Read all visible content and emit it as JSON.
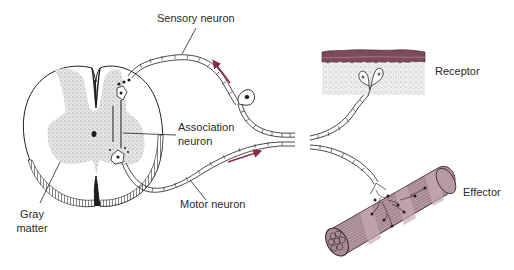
{
  "diagram": {
    "labels": {
      "sensory_neuron": "Sensory neuron",
      "receptor": "Receptor",
      "association_neuron_line1": "Association",
      "association_neuron_line2": "neuron",
      "effector": "Effector",
      "motor_neuron": "Motor neuron",
      "gray_matter_line1": "Gray",
      "gray_matter_line2": "matter"
    },
    "components": [
      {
        "id": "spinal-cord",
        "name": "Spinal cord cross-section"
      },
      {
        "id": "gray-matter",
        "name": "Gray matter (butterfly region)"
      },
      {
        "id": "sensory-neuron",
        "name": "Sensory neuron",
        "signal_direction": "toward spinal cord"
      },
      {
        "id": "association-neuron",
        "name": "Association neuron"
      },
      {
        "id": "motor-neuron",
        "name": "Motor neuron",
        "signal_direction": "away from spinal cord"
      },
      {
        "id": "receptor",
        "name": "Receptor in skin"
      },
      {
        "id": "effector",
        "name": "Effector (muscle)"
      }
    ],
    "colors": {
      "line": "#1e1e1e",
      "arrow": "#8a2a3e",
      "skin_top": "#7d4a5c",
      "muscle": "#b89aa4",
      "muscle_dark": "#5a3a45",
      "gray_matter": "#d4d4d4",
      "background": "#ffffff"
    }
  }
}
